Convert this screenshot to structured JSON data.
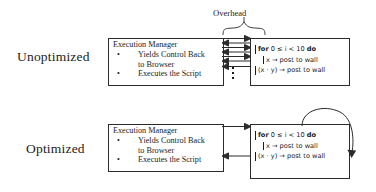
{
  "figure": {
    "title_label": "Overhead",
    "rows": [
      {
        "id": "unoptimized",
        "label": "Unoptimized",
        "execution_manager": {
          "title": "Execution Manager",
          "items": [
            {
              "line1": "Yields Control Back",
              "line2": "to Browser"
            },
            {
              "line1": "Executes the Script",
              "line2": ""
            }
          ],
          "bullet_glyph": "•"
        },
        "code": {
          "lines": [
            {
              "text": "for 0 ≤ i < 10 do",
              "indent": false,
              "keyword_prefix": "for",
              "keyword_suffix": "do"
            },
            {
              "text": "x → post to wall",
              "indent": true
            },
            {
              "text": "(x · y) → post to wall",
              "indent": false
            }
          ]
        },
        "arrows": {
          "description": "alternating message passing arrows",
          "right_count": 3,
          "left_count": 4,
          "ellipsis_glyph": "⋮",
          "ellipsis_dots": 3
        },
        "has_loop_arc": false
      },
      {
        "id": "optimized",
        "label": "Optimized",
        "execution_manager": {
          "title": "Execution Manager",
          "items": [
            {
              "line1": "Yields Control Back",
              "line2": "to Browser"
            },
            {
              "line1": "Executes the Script",
              "line2": ""
            }
          ],
          "bullet_glyph": "•"
        },
        "code": {
          "lines": [
            {
              "text": "for 0 ≤ i < 10 do",
              "indent": false,
              "keyword_prefix": "for",
              "keyword_suffix": "do"
            },
            {
              "text": "x → post to wall",
              "indent": true
            },
            {
              "text": "(x · y) → post to wall",
              "indent": false
            }
          ]
        },
        "arrows": {
          "description": "single round-trip arrows",
          "right_count": 1,
          "left_count": 1,
          "ellipsis_glyph": "",
          "ellipsis_dots": 0
        },
        "has_loop_arc": true
      }
    ]
  },
  "colors": {
    "stroke": "#2b2b2b",
    "text": "#1c1c1c",
    "background": "#ffffff"
  }
}
